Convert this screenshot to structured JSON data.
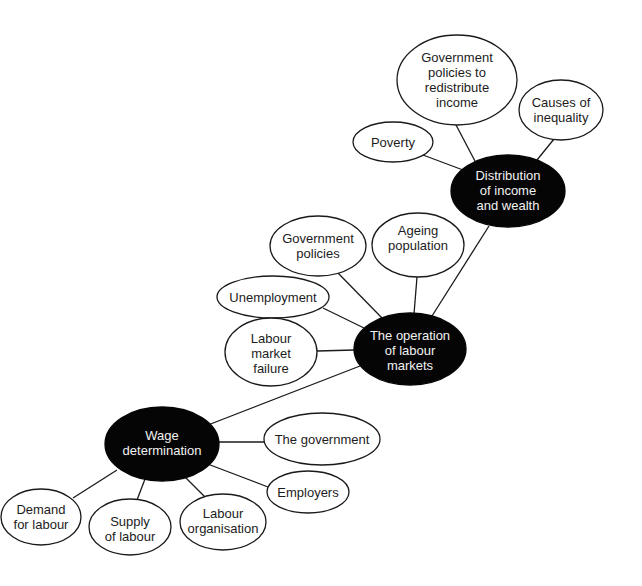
{
  "diagram": {
    "type": "mind-map",
    "nodes": [
      {
        "id": "gov_redistribute",
        "lines": [
          "Government",
          "policies to",
          "redistribute",
          "income"
        ],
        "style": "light"
      },
      {
        "id": "causes_inequality",
        "lines": [
          "Causes of",
          "inequality"
        ],
        "style": "light"
      },
      {
        "id": "poverty",
        "lines": [
          "Poverty"
        ],
        "style": "light"
      },
      {
        "id": "distribution",
        "lines": [
          "Distribution",
          "of income",
          "and wealth"
        ],
        "style": "dark"
      },
      {
        "id": "gov_policies",
        "lines": [
          "Government",
          "policies"
        ],
        "style": "light"
      },
      {
        "id": "ageing",
        "lines": [
          "Ageing",
          "population"
        ],
        "style": "light"
      },
      {
        "id": "unemployment",
        "lines": [
          "Unemployment"
        ],
        "style": "light"
      },
      {
        "id": "operation",
        "lines": [
          "The operation",
          "of labour",
          "markets"
        ],
        "style": "dark"
      },
      {
        "id": "market_failure",
        "lines": [
          "Labour",
          "market",
          "failure"
        ],
        "style": "light"
      },
      {
        "id": "wage",
        "lines": [
          "Wage",
          "determination"
        ],
        "style": "dark"
      },
      {
        "id": "the_government",
        "lines": [
          "The government"
        ],
        "style": "light"
      },
      {
        "id": "employers",
        "lines": [
          "Employers"
        ],
        "style": "light"
      },
      {
        "id": "demand",
        "lines": [
          "Demand",
          "for labour"
        ],
        "style": "light"
      },
      {
        "id": "supply",
        "lines": [
          "Supply",
          "of labour"
        ],
        "style": "light"
      },
      {
        "id": "organisation",
        "lines": [
          "Labour",
          "organisation"
        ],
        "style": "light"
      }
    ],
    "edges": [
      [
        "distribution",
        "gov_redistribute"
      ],
      [
        "distribution",
        "causes_inequality"
      ],
      [
        "distribution",
        "poverty"
      ],
      [
        "distribution",
        "operation"
      ],
      [
        "operation",
        "gov_policies"
      ],
      [
        "operation",
        "ageing"
      ],
      [
        "operation",
        "unemployment"
      ],
      [
        "operation",
        "market_failure"
      ],
      [
        "operation",
        "wage"
      ],
      [
        "wage",
        "the_government"
      ],
      [
        "wage",
        "employers"
      ],
      [
        "wage",
        "demand"
      ],
      [
        "wage",
        "supply"
      ],
      [
        "wage",
        "organisation"
      ]
    ],
    "colors": {
      "dark_fill": "#050505",
      "light_fill": "#ffffff",
      "stroke": "#1a1a1a",
      "dark_text": "#f2f2f2",
      "light_text": "#1c1c1c"
    }
  }
}
